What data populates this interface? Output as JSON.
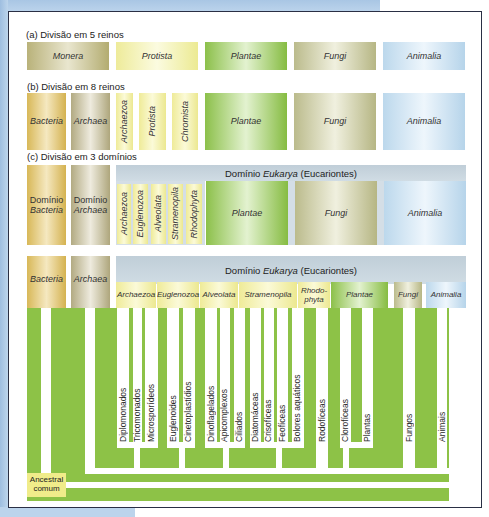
{
  "sections": {
    "a": {
      "title": "(a) Divisão em 5 reinos",
      "boxes": [
        "Monera",
        "Protista",
        "Plantae",
        "Fungi",
        "Animalia"
      ]
    },
    "b": {
      "title": "(b) Divisão em 8 reinos",
      "boxes": [
        "Bacteria",
        "Archaea",
        "Archaezoa",
        "Protista",
        "Chromista",
        "Plantae",
        "Fungi",
        "Animalia"
      ]
    },
    "c": {
      "title": "(c) Divisão em 3 domínios",
      "bacteria_line1": "Domínio",
      "bacteria_line2": "Bacteria",
      "archaea_line1": "Domínio",
      "archaea_line2": "Archaea",
      "eukarya_prefix": "Domínio ",
      "eukarya_name": "Eukarya",
      "eukarya_suffix": " (Eucariontes)",
      "protist_groups": [
        "Archaezoa",
        "Euglenozoa",
        "Alveolata",
        "Stramenopila",
        "Rhodophyta"
      ],
      "boxes": [
        "Plantae",
        "Fungi",
        "Animalia"
      ]
    },
    "d": {
      "bacteria": "Bacteria",
      "archaea": "Archaea",
      "eukarya_prefix": "Domínio ",
      "eukarya_name": "Eukarya",
      "eukarya_suffix": " (Eucariontes)",
      "groups": [
        "Archaezoa",
        "Euglenozoa",
        "Alveolata",
        "Stramenopila",
        "Rhodo-phyta",
        "Plantae",
        "Fungi",
        "Animalia"
      ],
      "rhodophyta_line1": "Rhodo-",
      "rhodophyta_line2": "phyta",
      "leaves": [
        "Diplomonados",
        "Tricomonados",
        "Microsporídeos",
        "Euglenoides",
        "Cinetoplastídios",
        "Dinoflagelados",
        "Apicomplexos",
        "Ciliados",
        "Diatomáceas",
        "Crisofíceas",
        "Feofíceas",
        "Bolores aquáticos",
        "Rodofíceas",
        "Clorofíceas",
        "Plantas",
        "Fungos",
        "Animais"
      ],
      "ancestor_line1": "Ancestral",
      "ancestor_line2": "comum"
    }
  },
  "colors": {
    "tree_green": "#8dc247",
    "frame_border": "#2a2f44",
    "ancestor_bg": "#f0ec8a"
  }
}
